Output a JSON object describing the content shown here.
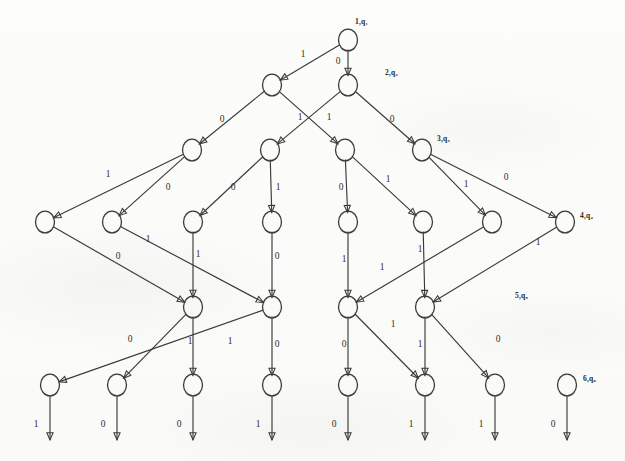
{
  "figure": {
    "node_radius": 9.5,
    "ink_color": "#3a3a3a",
    "paper_color": "#fdfdfc"
  },
  "stage_labels": [
    {
      "id": "stage-1",
      "text": "1,q₁",
      "x": 355,
      "y": 22
    },
    {
      "id": "stage-2",
      "text": "2,q₂",
      "x": 385,
      "y": 73
    },
    {
      "id": "stage-3",
      "text": "3,q₃",
      "x": 437,
      "y": 139
    },
    {
      "id": "stage-4",
      "text": "4,q₄",
      "x": 580,
      "y": 216
    },
    {
      "id": "stage-5",
      "text": "5,q₅",
      "x": 515,
      "y": 296
    },
    {
      "id": "stage-6",
      "text": "6,q₆",
      "x": 583,
      "y": 379
    }
  ],
  "nodes": [
    {
      "id": "n1",
      "row": 1,
      "col": 0,
      "x": 348,
      "y": 40
    },
    {
      "id": "n2a",
      "row": 2,
      "col": 0,
      "x": 272,
      "y": 85
    },
    {
      "id": "n2b",
      "row": 2,
      "col": 1,
      "x": 348,
      "y": 85
    },
    {
      "id": "n3a",
      "row": 3,
      "col": 0,
      "x": 192,
      "y": 150
    },
    {
      "id": "n3b",
      "row": 3,
      "col": 1,
      "x": 270,
      "y": 150
    },
    {
      "id": "n3c",
      "row": 3,
      "col": 2,
      "x": 345,
      "y": 150
    },
    {
      "id": "n3d",
      "row": 3,
      "col": 3,
      "x": 422,
      "y": 150
    },
    {
      "id": "n4a",
      "row": 4,
      "col": 0,
      "x": 45,
      "y": 222
    },
    {
      "id": "n4b",
      "row": 4,
      "col": 1,
      "x": 112,
      "y": 222
    },
    {
      "id": "n4c",
      "row": 4,
      "col": 2,
      "x": 193,
      "y": 222
    },
    {
      "id": "n4d",
      "row": 4,
      "col": 3,
      "x": 272,
      "y": 222
    },
    {
      "id": "n4e",
      "row": 4,
      "col": 4,
      "x": 348,
      "y": 222
    },
    {
      "id": "n4f",
      "row": 4,
      "col": 5,
      "x": 423,
      "y": 222
    },
    {
      "id": "n4g",
      "row": 4,
      "col": 6,
      "x": 492,
      "y": 222
    },
    {
      "id": "n4h",
      "row": 4,
      "col": 7,
      "x": 565,
      "y": 222
    },
    {
      "id": "n5a",
      "row": 5,
      "col": 0,
      "x": 193,
      "y": 307
    },
    {
      "id": "n5b",
      "row": 5,
      "col": 1,
      "x": 272,
      "y": 307
    },
    {
      "id": "n5c",
      "row": 5,
      "col": 2,
      "x": 348,
      "y": 307
    },
    {
      "id": "n5d",
      "row": 5,
      "col": 3,
      "x": 425,
      "y": 307
    },
    {
      "id": "n6a",
      "row": 6,
      "col": 0,
      "x": 50,
      "y": 385
    },
    {
      "id": "n6b",
      "row": 6,
      "col": 1,
      "x": 117,
      "y": 385
    },
    {
      "id": "n6c",
      "row": 6,
      "col": 2,
      "x": 193,
      "y": 385
    },
    {
      "id": "n6d",
      "row": 6,
      "col": 3,
      "x": 272,
      "y": 385
    },
    {
      "id": "n6e",
      "row": 6,
      "col": 4,
      "x": 348,
      "y": 385
    },
    {
      "id": "n6f",
      "row": 6,
      "col": 5,
      "x": 425,
      "y": 385
    },
    {
      "id": "n6g",
      "row": 6,
      "col": 6,
      "x": 495,
      "y": 385
    },
    {
      "id": "n6h",
      "row": 6,
      "col": 7,
      "x": 567,
      "y": 385
    }
  ],
  "edges": [
    {
      "id": "e1",
      "from": "n1",
      "to": "n2a",
      "label": "1",
      "lx": 303,
      "ly": 55
    },
    {
      "id": "e2",
      "from": "n1",
      "to": "n2b",
      "label": "0",
      "lx": 338,
      "ly": 62
    },
    {
      "id": "e3",
      "from": "n2a",
      "to": "n3a",
      "label": "0",
      "lx": 222,
      "ly": 120
    },
    {
      "id": "e4",
      "from": "n2a",
      "to": "n3c",
      "label": "1",
      "lx": 300,
      "ly": 118
    },
    {
      "id": "e5",
      "from": "n2b",
      "to": "n3b",
      "label": "1",
      "lx": 329,
      "ly": 118
    },
    {
      "id": "e6",
      "from": "n2b",
      "to": "n3d",
      "label": "0",
      "lx": 392,
      "ly": 120
    },
    {
      "id": "e7",
      "from": "n3a",
      "to": "n4a",
      "label": "1",
      "lx": 108,
      "ly": 175
    },
    {
      "id": "e8",
      "from": "n3a",
      "to": "n4b",
      "label": "0",
      "lx": 168,
      "ly": 188
    },
    {
      "id": "e9",
      "from": "n3b",
      "to": "n4c",
      "label": "0",
      "lx": 233,
      "ly": 188
    },
    {
      "id": "e10",
      "from": "n3b",
      "to": "n4d",
      "label": "1",
      "lx": 278,
      "ly": 188
    },
    {
      "id": "e11",
      "from": "n3c",
      "to": "n4e",
      "label": "0",
      "lx": 341,
      "ly": 188
    },
    {
      "id": "e12",
      "from": "n3c",
      "to": "n4f",
      "label": "1",
      "lx": 388,
      "ly": 180
    },
    {
      "id": "e13",
      "from": "n3d",
      "to": "n4g",
      "label": "1",
      "lx": 466,
      "ly": 185
    },
    {
      "id": "e14",
      "from": "n3d",
      "to": "n4h",
      "label": "0",
      "lx": 506,
      "ly": 178
    },
    {
      "id": "e15",
      "from": "n4a",
      "to": "n5a",
      "label": "0",
      "lx": 118,
      "ly": 257
    },
    {
      "id": "e16",
      "from": "n4b",
      "to": "n5b",
      "label": "1",
      "lx": 148,
      "ly": 240
    },
    {
      "id": "e17",
      "from": "n4c",
      "to": "n5a",
      "label": "1",
      "lx": 198,
      "ly": 255
    },
    {
      "id": "e18",
      "from": "n4d",
      "to": "n5b",
      "label": "0",
      "lx": 277,
      "ly": 257
    },
    {
      "id": "e19",
      "from": "n4e",
      "to": "n5c",
      "label": "1",
      "lx": 344,
      "ly": 260
    },
    {
      "id": "e20",
      "from": "n4f",
      "to": "n5d",
      "label": "1",
      "lx": 420,
      "ly": 250
    },
    {
      "id": "e21",
      "from": "n4g",
      "to": "n5c",
      "label": "1",
      "lx": 382,
      "ly": 268
    },
    {
      "id": "e22",
      "from": "n4h",
      "to": "n5d",
      "label": "1",
      "lx": 538,
      "ly": 243
    },
    {
      "id": "e23",
      "from": "n5a",
      "to": "n6b",
      "label": "1",
      "lx": 190,
      "ly": 342
    },
    {
      "id": "e24",
      "from": "n5a",
      "to": "n6c",
      "label": "0",
      "lx": 130,
      "ly": 340
    },
    {
      "id": "e25",
      "from": "n5b",
      "to": "n6a",
      "label": "1",
      "lx": 230,
      "ly": 342
    },
    {
      "id": "e26",
      "from": "n5b",
      "to": "n6d",
      "label": "0",
      "lx": 277,
      "ly": 345
    },
    {
      "id": "e27",
      "from": "n5c",
      "to": "n6e",
      "label": "0",
      "lx": 344,
      "ly": 345
    },
    {
      "id": "e28",
      "from": "n5c",
      "to": "n6f",
      "label": "1",
      "lx": 393,
      "ly": 325
    },
    {
      "id": "e29",
      "from": "n5d",
      "to": "n6f",
      "label": "1",
      "lx": 420,
      "ly": 345
    },
    {
      "id": "e30",
      "from": "n5d",
      "to": "n6g",
      "label": "0",
      "lx": 498,
      "ly": 340
    }
  ],
  "output_arrows": [
    {
      "id": "o1",
      "from": "n6a",
      "label": "1",
      "x": 50,
      "lx": 36,
      "ly": 425
    },
    {
      "id": "o2",
      "from": "n6b",
      "label": "0",
      "x": 117,
      "lx": 103,
      "ly": 425
    },
    {
      "id": "o3",
      "from": "n6c",
      "label": "0",
      "x": 193,
      "lx": 179,
      "ly": 425
    },
    {
      "id": "o4",
      "from": "n6d",
      "label": "1",
      "x": 272,
      "lx": 258,
      "ly": 425
    },
    {
      "id": "o5",
      "from": "n6e",
      "label": "0",
      "x": 348,
      "lx": 334,
      "ly": 425
    },
    {
      "id": "o6",
      "from": "n6f",
      "label": "1",
      "x": 425,
      "lx": 411,
      "ly": 425
    },
    {
      "id": "o7",
      "from": "n6g",
      "label": "1",
      "x": 495,
      "lx": 481,
      "ly": 425
    },
    {
      "id": "o8",
      "from": "n6h",
      "label": "0",
      "x": 567,
      "lx": 553,
      "ly": 425
    }
  ],
  "leftover_nodes": [
    {
      "id": "n6h-in",
      "from": "n5d",
      "to": "n6h",
      "note": "incoming from upper right"
    }
  ]
}
